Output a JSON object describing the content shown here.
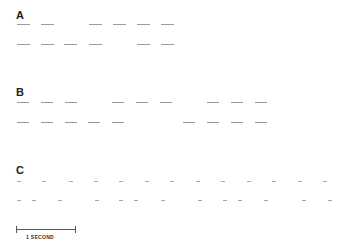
{
  "panels": [
    {
      "label": "A",
      "rows": [
        {
          "y": 24,
          "dashes": [
            [
              17,
              13
            ],
            [
              41,
              13
            ],
            [
              89,
              13
            ],
            [
              113,
              13
            ],
            [
              137,
              13
            ],
            [
              161,
              13
            ]
          ]
        },
        {
          "y": 44,
          "dashes": [
            [
              17,
              13
            ],
            [
              41,
              13
            ],
            [
              64,
              13
            ],
            [
              89,
              13
            ],
            [
              137,
              13
            ],
            [
              161,
              13
            ]
          ]
        }
      ]
    },
    {
      "label": "B",
      "rows": [
        {
          "y": 102,
          "dashes": [
            [
              17,
              12
            ],
            [
              41,
              12
            ],
            [
              65,
              12
            ],
            [
              112,
              12
            ],
            [
              136,
              12
            ],
            [
              160,
              12
            ],
            [
              207,
              12
            ],
            [
              231,
              12
            ],
            [
              255,
              12
            ]
          ]
        },
        {
          "y": 122,
          "dashes": [
            [
              17,
              12
            ],
            [
              41,
              12
            ],
            [
              65,
              12
            ],
            [
              88,
              12
            ],
            [
              112,
              12
            ],
            [
              183,
              12
            ],
            [
              207,
              12
            ],
            [
              231,
              12
            ],
            [
              255,
              12
            ]
          ]
        }
      ]
    },
    {
      "label": "C",
      "rows": [
        {
          "y": 181,
          "ticks": [
            17,
            42,
            69,
            94,
            119,
            145,
            170,
            196,
            221,
            247,
            272,
            298,
            323
          ]
        },
        {
          "y": 200,
          "ticks": [
            17,
            32,
            58,
            95,
            119,
            134,
            161,
            198,
            223,
            238,
            264,
            302,
            328
          ]
        }
      ]
    }
  ],
  "scale_bar": {
    "label": "1 SECOND"
  }
}
